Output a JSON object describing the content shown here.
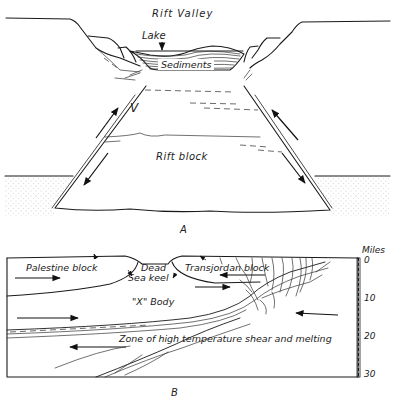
{
  "figure_a": {
    "title": "Rift Valley",
    "labels": {
      "lake": "Lake",
      "sediments": "Sediments",
      "rift_block": "Rift block",
      "v_mark": "V"
    },
    "caption": "A"
  },
  "figure_b": {
    "labels": {
      "palestine_block": "Palestine block",
      "dead_sea_keel_line1": "Dead",
      "dead_sea_keel_line2": "Sea keel",
      "transjordan_block": "Transjordan block",
      "x_body": "\"X\" Body",
      "shear_zone": "Zone of high temperature shear and melting"
    },
    "scale": {
      "unit": "Miles",
      "ticks": [
        "0",
        "10",
        "20",
        "30"
      ]
    },
    "caption": "B"
  },
  "colors": {
    "ink": "#1a1a1a",
    "paper": "#ffffff",
    "stipple": "#9a9a9a"
  }
}
